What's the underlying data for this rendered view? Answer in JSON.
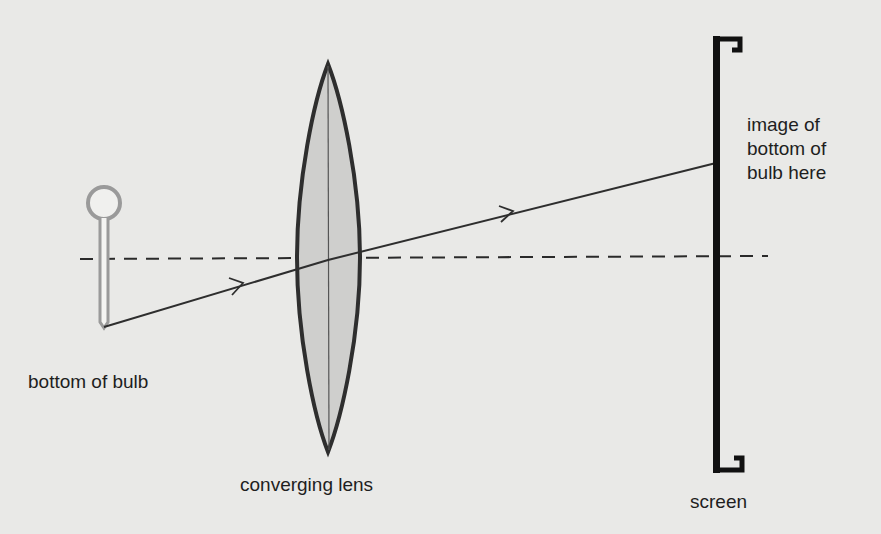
{
  "labels": {
    "bulb": "bottom of bulb",
    "lens": "converging lens",
    "image_line1": "image of",
    "image_line2": "bottom of",
    "image_line3": "bulb here",
    "screen": "screen"
  },
  "colors": {
    "background": "#e9e9e7",
    "ink": "#2a2a2a",
    "lens_fill": "#cfcfcd",
    "bulb_outline": "#999999"
  }
}
